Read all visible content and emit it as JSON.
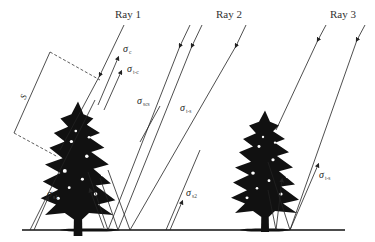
{
  "diagram": {
    "type": "radar-backscatter-scattering-mechanisms",
    "rays": [
      {
        "label": "Ray 1"
      },
      {
        "label": "Ray 2"
      },
      {
        "label": "Ray 3"
      }
    ],
    "dimension_label": "S",
    "mechanisms": [
      {
        "symbol": "σ",
        "sub": "c"
      },
      {
        "symbol": "σ",
        "sub": "t-c"
      },
      {
        "symbol": "σ",
        "sub": "scs"
      },
      {
        "symbol": "σ",
        "sub": "t-s"
      },
      {
        "symbol": "σ",
        "sub": "s1"
      },
      {
        "symbol": "σ",
        "sub": "s2"
      },
      {
        "symbol": "σ",
        "sub": "t-s"
      }
    ],
    "colors": {
      "ink": "#222222",
      "background": "#ffffff"
    }
  }
}
